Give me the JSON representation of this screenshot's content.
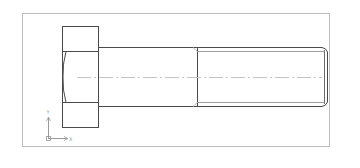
{
  "drawing": {
    "subject": "hex-head-bolt-side-view",
    "colors": {
      "background": "#ffffff",
      "frame": "#bdbdbd",
      "outline": "#4a4a4a",
      "thread_root": "#9e9e9e",
      "centerline": "#c4c4c4",
      "ucs": "#9a9a9a"
    }
  },
  "ucs_icon": {
    "x_label": "X",
    "y_label": "Y"
  }
}
